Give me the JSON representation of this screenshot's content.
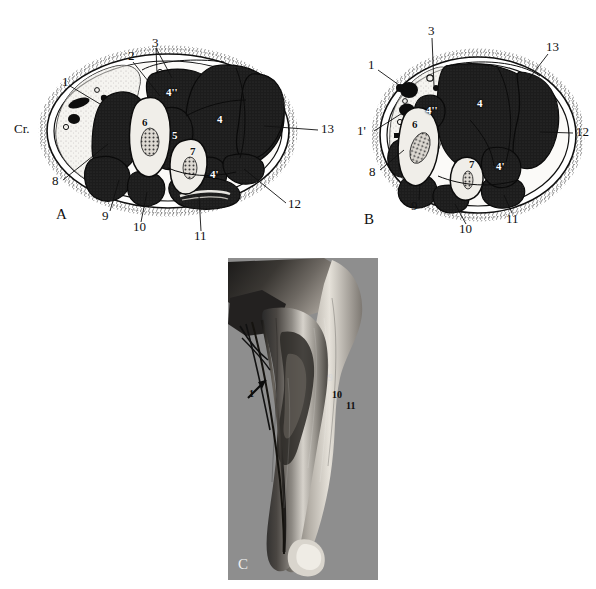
{
  "figure": {
    "type": "anatomical-cross-section-plate",
    "panels": [
      {
        "id": "A",
        "letter": "A",
        "orientation_label": "Cr.",
        "outer_labels": [
          {
            "id": "a-1",
            "text": "1",
            "x": 62,
            "y": 82
          },
          {
            "id": "a-2",
            "text": "2",
            "x": 128,
            "y": 56
          },
          {
            "id": "a-3",
            "text": "3",
            "x": 152,
            "y": 43
          },
          {
            "id": "a-8",
            "text": "8",
            "x": 55,
            "y": 181
          },
          {
            "id": "a-9",
            "text": "9",
            "x": 104,
            "y": 216
          },
          {
            "id": "a-10",
            "text": "10",
            "x": 135,
            "y": 227
          },
          {
            "id": "a-11",
            "text": "11",
            "x": 196,
            "y": 236
          },
          {
            "id": "a-12",
            "text": "12",
            "x": 289,
            "y": 205
          },
          {
            "id": "a-13",
            "text": "13",
            "x": 323,
            "y": 128
          }
        ],
        "inner_labels": [
          {
            "id": "a-i4dd",
            "text": "4''",
            "x": 168,
            "y": 91,
            "tone": "light"
          },
          {
            "id": "a-i6",
            "text": "6",
            "x": 143,
            "y": 121,
            "tone": "dark"
          },
          {
            "id": "a-i5",
            "text": "5",
            "x": 173,
            "y": 134,
            "tone": "light"
          },
          {
            "id": "a-i7",
            "text": "7",
            "x": 191,
            "y": 150,
            "tone": "dark"
          },
          {
            "id": "a-i4",
            "text": "4",
            "x": 218,
            "y": 118,
            "tone": "light"
          },
          {
            "id": "a-i4p",
            "text": "4'",
            "x": 212,
            "y": 173,
            "tone": "light"
          }
        ]
      },
      {
        "id": "B",
        "letter": "B",
        "outer_labels": [
          {
            "id": "b-1",
            "text": "1",
            "x": 369,
            "y": 64
          },
          {
            "id": "b-1p",
            "text": "1'",
            "x": 361,
            "y": 130
          },
          {
            "id": "b-3",
            "text": "3",
            "x": 429,
            "y": 30
          },
          {
            "id": "b-8",
            "text": "8",
            "x": 371,
            "y": 172
          },
          {
            "id": "b-9",
            "text": "9",
            "x": 413,
            "y": 206
          },
          {
            "id": "b-10",
            "text": "10",
            "x": 461,
            "y": 229
          },
          {
            "id": "b-11",
            "text": "11",
            "x": 508,
            "y": 219
          },
          {
            "id": "b-12",
            "text": "12",
            "x": 577,
            "y": 131
          },
          {
            "id": "b-13",
            "text": "13",
            "x": 547,
            "y": 46
          }
        ],
        "inner_labels": [
          {
            "id": "b-i4dd",
            "text": "4''",
            "x": 428,
            "y": 109,
            "tone": "light"
          },
          {
            "id": "b-i4",
            "text": "4",
            "x": 478,
            "y": 102,
            "tone": "light"
          },
          {
            "id": "b-i6",
            "text": "6",
            "x": 413,
            "y": 123,
            "tone": "dark"
          },
          {
            "id": "b-i7",
            "text": "7",
            "x": 471,
            "y": 163,
            "tone": "dark"
          },
          {
            "id": "b-i4p",
            "text": "4'",
            "x": 498,
            "y": 165,
            "tone": "light"
          }
        ]
      },
      {
        "id": "C",
        "letter": "C",
        "kind": "photograph",
        "background_color": "#8e8e8e",
        "labels": [
          {
            "id": "c-1",
            "text": "1",
            "x": 250,
            "y": 393,
            "tone": "dark"
          },
          {
            "id": "c-10",
            "text": "10",
            "x": 333,
            "y": 395,
            "tone": "dark"
          },
          {
            "id": "c-11",
            "text": "11",
            "x": 347,
            "y": 406,
            "tone": "dark"
          },
          {
            "id": "c-9",
            "text": "9",
            "x": 329,
            "y": 378,
            "tone": "light"
          }
        ],
        "has_arrow": true
      }
    ],
    "colors": {
      "muscle_fill": "#1c1c1c",
      "fascia_fill": "#f2f0ec",
      "bone_fill": "#e9e7e2",
      "fat_fill": "#e6e4df",
      "skin_outline": "#101010",
      "photo_bg": "#8e8e8e"
    }
  }
}
